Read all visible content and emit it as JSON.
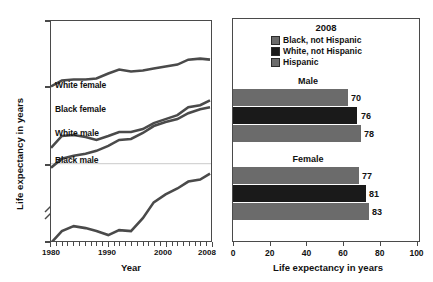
{
  "chart_data": [
    {
      "type": "line",
      "title": "",
      "xlabel": "Year",
      "ylabel": "Life expectancy in years",
      "xlim": [
        1980,
        2008
      ],
      "ylim": [
        60,
        100
      ],
      "yticks": [
        "0",
        "60",
        "80",
        "100"
      ],
      "xticks": [
        "1980",
        "1990",
        "2000",
        "2008"
      ],
      "axis_break": true,
      "grid": "horizontal-at-60",
      "series": [
        {
          "name": "White female",
          "label": "White female",
          "color": "#4a4a4a",
          "x": [
            1980,
            1982,
            1984,
            1986,
            1988,
            1990,
            1992,
            1994,
            1996,
            1998,
            2000,
            2002,
            2004,
            2006,
            2008
          ],
          "values": [
            78.1,
            78.7,
            78.8,
            78.8,
            78.9,
            79.4,
            79.8,
            79.6,
            79.7,
            79.9,
            80.1,
            80.3,
            80.8,
            80.9,
            80.8
          ]
        },
        {
          "name": "Black female",
          "label": "Black female",
          "color": "#4a4a4a",
          "x": [
            1980,
            1982,
            1984,
            1986,
            1988,
            1990,
            1992,
            1994,
            1996,
            1998,
            2000,
            2002,
            2004,
            2006,
            2008
          ],
          "values": [
            72.5,
            73.6,
            73.7,
            73.5,
            73.2,
            73.6,
            74.0,
            74.0,
            74.3,
            74.8,
            75.2,
            75.6,
            76.3,
            76.5,
            77.0
          ]
        },
        {
          "name": "White male",
          "label": "White male",
          "color": "#4a4a4a",
          "x": [
            1980,
            1982,
            1984,
            1986,
            1988,
            1990,
            1992,
            1994,
            1996,
            1998,
            2000,
            2002,
            2004,
            2006,
            2008
          ],
          "values": [
            70.7,
            71.5,
            71.8,
            72.0,
            72.2,
            72.7,
            73.2,
            73.3,
            73.9,
            74.5,
            74.9,
            75.1,
            75.7,
            76.0,
            76.2
          ]
        },
        {
          "name": "Black male",
          "label": "Black male",
          "color": "#4a4a4a",
          "x": [
            1980,
            1982,
            1984,
            1986,
            1988,
            1990,
            1992,
            1994,
            1996,
            1998,
            2000,
            2002,
            2004,
            2006,
            2008
          ],
          "values": [
            63.8,
            64.9,
            65.3,
            65.2,
            64.9,
            64.5,
            65.0,
            64.9,
            66.1,
            67.6,
            68.3,
            68.8,
            69.5,
            69.7,
            70.2
          ]
        }
      ]
    },
    {
      "type": "bar",
      "orientation": "horizontal",
      "title": "2008",
      "xlabel": "Life expectancy in years",
      "ylabel": "",
      "xlim": [
        0,
        100
      ],
      "xticks": [
        "0",
        "20",
        "40",
        "60",
        "80",
        "100"
      ],
      "groups": [
        "Male",
        "Female"
      ],
      "legend": [
        {
          "label": "Black, not Hispanic",
          "color": "#6b6b6b"
        },
        {
          "label": "White, not Hispanic",
          "color": "#1a1a1a"
        },
        {
          "label": "Hispanic",
          "color": "#6b6b6b"
        }
      ],
      "bars": [
        {
          "group": "Male",
          "series": "Black, not Hispanic",
          "value": 70,
          "value_label": "70",
          "color": "#6b6b6b"
        },
        {
          "group": "Male",
          "series": "White, not Hispanic",
          "value": 76,
          "value_label": "76",
          "color": "#1a1a1a"
        },
        {
          "group": "Male",
          "series": "Hispanic",
          "value": 78,
          "value_label": "78",
          "color": "#6b6b6b"
        },
        {
          "group": "Female",
          "series": "Black, not Hispanic",
          "value": 77,
          "value_label": "77",
          "color": "#6b6b6b"
        },
        {
          "group": "Female",
          "series": "White, not Hispanic",
          "value": 81,
          "value_label": "81",
          "color": "#1a1a1a"
        },
        {
          "group": "Female",
          "series": "Hispanic",
          "value": 83,
          "value_label": "83",
          "color": "#6b6b6b"
        }
      ]
    }
  ],
  "line_chart": {
    "ylabel": "Life expectancy in years",
    "xlabel": "Year",
    "yticks": {
      "t0": "0",
      "t60": "60",
      "t80": "80",
      "t100": "100"
    },
    "xticks": {
      "x1980": "1980",
      "x1990": "1990",
      "x2000": "2000",
      "x2008": "2008"
    },
    "labels": {
      "white_female": "White female",
      "black_female": "Black female",
      "white_male": "White male",
      "black_male": "Black male"
    }
  },
  "bar_chart": {
    "legend_title": "2008",
    "legend": {
      "black": "Black, not Hispanic",
      "white": "White, not Hispanic",
      "hispanic": "Hispanic"
    },
    "groups": {
      "male": "Male",
      "female": "Female"
    },
    "values": {
      "male_black": "70",
      "male_white": "76",
      "male_hispanic": "78",
      "female_black": "77",
      "female_white": "81",
      "female_hispanic": "83"
    },
    "xticks": {
      "x0": "0",
      "x20": "20",
      "x40": "40",
      "x60": "60",
      "x80": "80",
      "x100": "100"
    },
    "xlabel": "Life expectancy in years"
  },
  "colors": {
    "gray_bar": "#6b6b6b",
    "black_bar": "#1a1a1a",
    "axis": "#4a4a4a",
    "grid": "#c9c9c9",
    "line": "#4a4a4a"
  }
}
